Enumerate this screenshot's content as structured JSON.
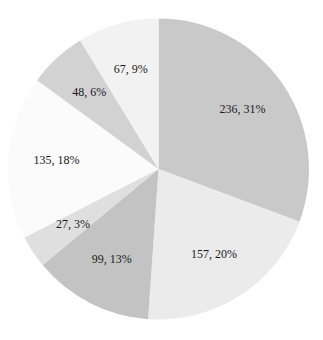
{
  "chart_data": {
    "type": "pie",
    "title": "",
    "start": "top",
    "direction": "clockwise",
    "legend": "none",
    "slices": [
      {
        "value": 236,
        "percent": 31,
        "label": "236, 31%",
        "color": "#c9c9c9"
      },
      {
        "value": 157,
        "percent": 20,
        "label": "157, 20%",
        "color": "#ebebeb"
      },
      {
        "value": 99,
        "percent": 13,
        "label": "99, 13%",
        "color": "#c3c3c3"
      },
      {
        "value": 27,
        "percent": 3,
        "label": "27, 3%",
        "color": "#dfdfdf"
      },
      {
        "value": 135,
        "percent": 18,
        "label": "135, 18%",
        "color": "#fbfbfb"
      },
      {
        "value": 48,
        "percent": 6,
        "label": "48, 6%",
        "color": "#d2d2d2"
      },
      {
        "value": 67,
        "percent": 9,
        "label": "67, 9%",
        "color": "#f2f2f2"
      }
    ]
  }
}
